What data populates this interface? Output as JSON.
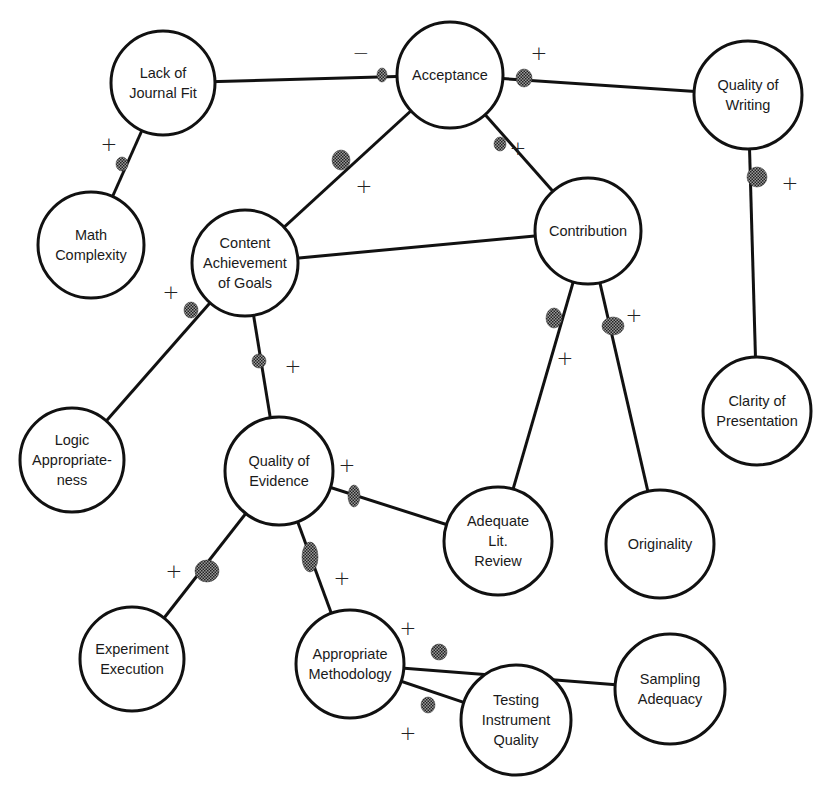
{
  "colors": {
    "line": "#111111",
    "node_fill": "#ffffff",
    "marker_fill": "#555555",
    "text": "#1a1a1a"
  },
  "nodes": [
    {
      "id": "lack_of_journal_fit",
      "lines": [
        "Lack of",
        "Journal Fit"
      ],
      "cx": 163,
      "cy": 83,
      "r": 52
    },
    {
      "id": "acceptance",
      "lines": [
        "Acceptance"
      ],
      "cx": 450,
      "cy": 75,
      "r": 53
    },
    {
      "id": "quality_of_writing",
      "lines": [
        "Quality of",
        "Writing"
      ],
      "cx": 748,
      "cy": 95,
      "r": 54
    },
    {
      "id": "math_complexity",
      "lines": [
        "Math",
        "Complexity"
      ],
      "cx": 91,
      "cy": 245,
      "r": 53
    },
    {
      "id": "content_achievement_of_goals",
      "lines": [
        "Content",
        "Achievement",
        "of Goals"
      ],
      "cx": 245,
      "cy": 263,
      "r": 53
    },
    {
      "id": "contribution",
      "lines": [
        "Contribution"
      ],
      "cx": 588,
      "cy": 231,
      "r": 53
    },
    {
      "id": "logic_appropriateness",
      "lines": [
        "Logic",
        "Appropriate-",
        "ness"
      ],
      "cx": 72,
      "cy": 460,
      "r": 52
    },
    {
      "id": "quality_of_evidence",
      "lines": [
        "Quality of",
        "Evidence"
      ],
      "cx": 279,
      "cy": 471,
      "r": 54
    },
    {
      "id": "clarity_of_presentation",
      "lines": [
        "Clarity of",
        "Presentation"
      ],
      "cx": 757,
      "cy": 411,
      "r": 54
    },
    {
      "id": "adequate_lit_review",
      "lines": [
        "Adequate",
        "Lit.",
        "Review"
      ],
      "cx": 498,
      "cy": 541,
      "r": 54
    },
    {
      "id": "originality",
      "lines": [
        "Originality"
      ],
      "cx": 660,
      "cy": 544,
      "r": 54
    },
    {
      "id": "experiment_execution",
      "lines": [
        "Experiment",
        "Execution"
      ],
      "cx": 132,
      "cy": 659,
      "r": 52
    },
    {
      "id": "appropriate_methodology",
      "lines": [
        "Appropriate",
        "Methodology"
      ],
      "cx": 350,
      "cy": 664,
      "r": 54
    },
    {
      "id": "testing_instrument_quality",
      "lines": [
        "Testing",
        "Instrument",
        "Quality"
      ],
      "cx": 516,
      "cy": 720,
      "r": 55
    },
    {
      "id": "sampling_adequacy",
      "lines": [
        "Sampling",
        "Adequacy"
      ],
      "cx": 670,
      "cy": 689,
      "r": 55
    }
  ],
  "edges": [
    {
      "from": "lack_of_journal_fit",
      "to": "acceptance",
      "sign": "−",
      "marker": [
        382,
        75
      ],
      "marker_rx": 5,
      "marker_ry": 7,
      "sign_pos": [
        361,
        53
      ]
    },
    {
      "from": "acceptance",
      "to": "quality_of_writing",
      "sign": "+",
      "marker": [
        524,
        78
      ],
      "marker_rx": 8,
      "marker_ry": 9,
      "sign_pos": [
        539,
        53
      ]
    },
    {
      "from": "lack_of_journal_fit",
      "to": "math_complexity",
      "sign": "+",
      "marker": [
        122,
        164
      ],
      "marker_rx": 6,
      "marker_ry": 7,
      "sign_pos": [
        109,
        144
      ]
    },
    {
      "from": "acceptance",
      "to": "content_achievement_of_goals",
      "sign": "+",
      "marker": [
        341,
        160
      ],
      "marker_rx": 9,
      "marker_ry": 10,
      "sign_pos": [
        364,
        186
      ]
    },
    {
      "from": "acceptance",
      "to": "contribution",
      "sign": "+",
      "marker": [
        500,
        144
      ],
      "marker_rx": 6,
      "marker_ry": 7,
      "sign_pos": [
        518,
        148
      ]
    },
    {
      "from": "content_achievement_of_goals",
      "to": "contribution",
      "sign": "",
      "marker": null
    },
    {
      "from": "quality_of_writing",
      "to": "clarity_of_presentation",
      "sign": "+",
      "marker": [
        757,
        177
      ],
      "marker_rx": 10,
      "marker_ry": 10,
      "sign_pos": [
        790,
        183
      ]
    },
    {
      "from": "content_achievement_of_goals",
      "to": "logic_appropriateness",
      "sign": "+",
      "marker": [
        191,
        310
      ],
      "marker_rx": 7,
      "marker_ry": 8,
      "sign_pos": [
        171,
        292
      ]
    },
    {
      "from": "content_achievement_of_goals",
      "to": "quality_of_evidence",
      "sign": "+",
      "marker": [
        259,
        361
      ],
      "marker_rx": 7,
      "marker_ry": 7,
      "sign_pos": [
        293,
        366
      ]
    },
    {
      "from": "contribution",
      "to": "adequate_lit_review",
      "sign": "+",
      "marker": [
        554,
        318
      ],
      "marker_rx": 8,
      "marker_ry": 10,
      "sign_pos": [
        565,
        358
      ]
    },
    {
      "from": "contribution",
      "to": "originality",
      "sign": "+",
      "marker": [
        613,
        326
      ],
      "marker_rx": 11,
      "marker_ry": 9,
      "sign_pos": [
        634,
        315
      ]
    },
    {
      "from": "quality_of_evidence",
      "to": "adequate_lit_review",
      "sign": "+",
      "marker": [
        354,
        496
      ],
      "marker_rx": 6,
      "marker_ry": 11,
      "sign_pos": [
        347,
        465
      ]
    },
    {
      "from": "quality_of_evidence",
      "to": "experiment_execution",
      "sign": "+",
      "marker": [
        207,
        571
      ],
      "marker_rx": 12,
      "marker_ry": 11,
      "sign_pos": [
        174,
        571
      ]
    },
    {
      "from": "quality_of_evidence",
      "to": "appropriate_methodology",
      "sign": "+",
      "marker": [
        310,
        557
      ],
      "marker_rx": 8,
      "marker_ry": 15,
      "sign_pos": [
        342,
        578
      ]
    },
    {
      "from": "appropriate_methodology",
      "to": "sampling_adequacy",
      "sign": "+",
      "marker": [
        439,
        652
      ],
      "marker_rx": 8,
      "marker_ry": 8,
      "sign_pos": [
        408,
        628
      ]
    },
    {
      "from": "appropriate_methodology",
      "to": "testing_instrument_quality",
      "sign": "+",
      "marker": [
        428,
        705
      ],
      "marker_rx": 7,
      "marker_ry": 8,
      "sign_pos": [
        408,
        733
      ]
    }
  ]
}
